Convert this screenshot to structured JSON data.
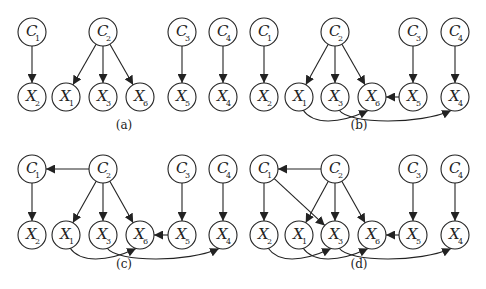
{
  "figure": {
    "colors": {
      "stroke": "#222222",
      "background": "#ffffff"
    },
    "panels": [
      {
        "id": "a",
        "caption": "(a)",
        "caption_pos": [
          124,
          129
        ],
        "nodes": [
          {
            "id": "C1",
            "letter": "C",
            "sub": "1",
            "x": 32,
            "y": 32
          },
          {
            "id": "C2",
            "letter": "C",
            "sub": "2",
            "x": 103,
            "y": 32
          },
          {
            "id": "C3",
            "letter": "C",
            "sub": "3",
            "x": 182,
            "y": 32
          },
          {
            "id": "C4",
            "letter": "C",
            "sub": "4",
            "x": 223,
            "y": 32
          },
          {
            "id": "X2",
            "letter": "X",
            "sub": "2",
            "x": 32,
            "y": 97
          },
          {
            "id": "X1",
            "letter": "X",
            "sub": "1",
            "x": 66,
            "y": 97
          },
          {
            "id": "X3",
            "letter": "X",
            "sub": "3",
            "x": 103,
            "y": 97
          },
          {
            "id": "X6",
            "letter": "X",
            "sub": "6",
            "x": 140,
            "y": 97
          },
          {
            "id": "X5",
            "letter": "X",
            "sub": "5",
            "x": 182,
            "y": 97
          },
          {
            "id": "X4",
            "letter": "X",
            "sub": "4",
            "x": 223,
            "y": 97
          }
        ],
        "edges": [
          {
            "from": "C1",
            "to": "X2"
          },
          {
            "from": "C2",
            "to": "X1"
          },
          {
            "from": "C2",
            "to": "X3"
          },
          {
            "from": "C2",
            "to": "X6"
          },
          {
            "from": "C3",
            "to": "X5"
          },
          {
            "from": "C4",
            "to": "X4"
          }
        ]
      },
      {
        "id": "b",
        "caption": "(b)",
        "caption_pos": [
          359,
          129
        ],
        "nodes": [
          {
            "id": "C1",
            "letter": "C",
            "sub": "1",
            "x": 264,
            "y": 32
          },
          {
            "id": "C2",
            "letter": "C",
            "sub": "2",
            "x": 335,
            "y": 32
          },
          {
            "id": "C3",
            "letter": "C",
            "sub": "3",
            "x": 413,
            "y": 32
          },
          {
            "id": "C4",
            "letter": "C",
            "sub": "4",
            "x": 455,
            "y": 32
          },
          {
            "id": "X2",
            "letter": "X",
            "sub": "2",
            "x": 264,
            "y": 97
          },
          {
            "id": "X1",
            "letter": "X",
            "sub": "1",
            "x": 299,
            "y": 97
          },
          {
            "id": "X3",
            "letter": "X",
            "sub": "3",
            "x": 335,
            "y": 97
          },
          {
            "id": "X6",
            "letter": "X",
            "sub": "6",
            "x": 372,
            "y": 97
          },
          {
            "id": "X5",
            "letter": "X",
            "sub": "5",
            "x": 413,
            "y": 97
          },
          {
            "id": "X4",
            "letter": "X",
            "sub": "4",
            "x": 455,
            "y": 97
          }
        ],
        "edges": [
          {
            "from": "C1",
            "to": "X2"
          },
          {
            "from": "C2",
            "to": "X1"
          },
          {
            "from": "C2",
            "to": "X3"
          },
          {
            "from": "C2",
            "to": "X6"
          },
          {
            "from": "C3",
            "to": "X5"
          },
          {
            "from": "C4",
            "to": "X4"
          },
          {
            "from": "X5",
            "to": "X6"
          },
          {
            "from": "X1",
            "to": "X6",
            "curve": true
          },
          {
            "from": "X3",
            "to": "X4",
            "curve": true
          }
        ]
      },
      {
        "id": "c",
        "caption": "(c)",
        "caption_pos": [
          124,
          268
        ],
        "nodes": [
          {
            "id": "C1",
            "letter": "C",
            "sub": "1",
            "x": 32,
            "y": 169
          },
          {
            "id": "C2",
            "letter": "C",
            "sub": "2",
            "x": 103,
            "y": 169
          },
          {
            "id": "C3",
            "letter": "C",
            "sub": "3",
            "x": 182,
            "y": 169
          },
          {
            "id": "C4",
            "letter": "C",
            "sub": "4",
            "x": 223,
            "y": 169
          },
          {
            "id": "X2",
            "letter": "X",
            "sub": "2",
            "x": 32,
            "y": 235
          },
          {
            "id": "X1",
            "letter": "X",
            "sub": "1",
            "x": 66,
            "y": 235
          },
          {
            "id": "X3",
            "letter": "X",
            "sub": "3",
            "x": 103,
            "y": 235
          },
          {
            "id": "X6",
            "letter": "X",
            "sub": "6",
            "x": 140,
            "y": 235
          },
          {
            "id": "X5",
            "letter": "X",
            "sub": "5",
            "x": 182,
            "y": 235
          },
          {
            "id": "X4",
            "letter": "X",
            "sub": "4",
            "x": 223,
            "y": 235
          }
        ],
        "edges": [
          {
            "from": "C2",
            "to": "C1"
          },
          {
            "from": "C1",
            "to": "X2"
          },
          {
            "from": "C2",
            "to": "X1"
          },
          {
            "from": "C2",
            "to": "X3"
          },
          {
            "from": "C2",
            "to": "X6"
          },
          {
            "from": "C3",
            "to": "X5"
          },
          {
            "from": "C4",
            "to": "X4"
          },
          {
            "from": "X5",
            "to": "X6"
          },
          {
            "from": "X1",
            "to": "X6",
            "curve": true
          },
          {
            "from": "X3",
            "to": "X4",
            "curve": true
          }
        ]
      },
      {
        "id": "d",
        "caption": "(d)",
        "caption_pos": [
          359,
          268
        ],
        "nodes": [
          {
            "id": "C1",
            "letter": "C",
            "sub": "1",
            "x": 264,
            "y": 169
          },
          {
            "id": "C2",
            "letter": "C",
            "sub": "2",
            "x": 335,
            "y": 169
          },
          {
            "id": "C3",
            "letter": "C",
            "sub": "3",
            "x": 413,
            "y": 169
          },
          {
            "id": "C4",
            "letter": "C",
            "sub": "4",
            "x": 455,
            "y": 169
          },
          {
            "id": "X2",
            "letter": "X",
            "sub": "2",
            "x": 264,
            "y": 235
          },
          {
            "id": "X1",
            "letter": "X",
            "sub": "1",
            "x": 299,
            "y": 235
          },
          {
            "id": "X3",
            "letter": "X",
            "sub": "3",
            "x": 335,
            "y": 235
          },
          {
            "id": "X6",
            "letter": "X",
            "sub": "6",
            "x": 372,
            "y": 235
          },
          {
            "id": "X5",
            "letter": "X",
            "sub": "5",
            "x": 413,
            "y": 235
          },
          {
            "id": "X4",
            "letter": "X",
            "sub": "4",
            "x": 455,
            "y": 235
          }
        ],
        "edges": [
          {
            "from": "C2",
            "to": "C1"
          },
          {
            "from": "C1",
            "to": "X2"
          },
          {
            "from": "C1",
            "to": "X3"
          },
          {
            "from": "C2",
            "to": "X1"
          },
          {
            "from": "C2",
            "to": "X3"
          },
          {
            "from": "C2",
            "to": "X6"
          },
          {
            "from": "C3",
            "to": "X5"
          },
          {
            "from": "C4",
            "to": "X4"
          },
          {
            "from": "X5",
            "to": "X6"
          },
          {
            "from": "X2",
            "to": "X3",
            "curve": true
          },
          {
            "from": "X1",
            "to": "X6",
            "curve": true
          },
          {
            "from": "X3",
            "to": "X4",
            "curve": true
          }
        ]
      }
    ]
  }
}
